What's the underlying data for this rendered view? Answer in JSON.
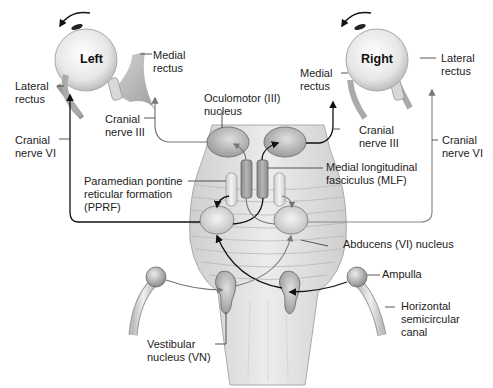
{
  "diagram": {
    "eyes": {
      "left": {
        "title": "Left"
      },
      "right": {
        "title": "Right"
      }
    },
    "labels": {
      "left_medial_rectus": "Medial\nrectus",
      "left_lateral_rectus": "Lateral\nrectus",
      "left_cranial_nerve_iii": "Cranial\nnerve III",
      "left_cranial_nerve_vi": "Cranial\nnerve VI",
      "right_medial_rectus": "Medial\nrectus",
      "right_lateral_rectus": "Lateral\nrectus",
      "right_cranial_nerve_iii": "Cranial\nnerve III",
      "right_cranial_nerve_vi": "Cranial\nnerve VI",
      "oculomotor_nucleus": "Oculomotor (III)\nnucleus",
      "pprf": "Paramedian pontine\nreticular formation\n(PPRF)",
      "mlf": "Medial longitudinal\nfasciculus (MLF)",
      "abducens_nucleus": "Abducens (VI) nucleus",
      "ampulla": "Ampulla",
      "horizontal_canal": "Horizontal\nsemicircular\ncanal",
      "vestibular_nucleus": "Vestibular\nnucleus (VN)"
    },
    "colors": {
      "structure_fill": "#dcdcdc",
      "nucleus_fill": "#c8c8c8",
      "line_dark": "#111111",
      "line_gray": "#8a8a8a"
    }
  }
}
